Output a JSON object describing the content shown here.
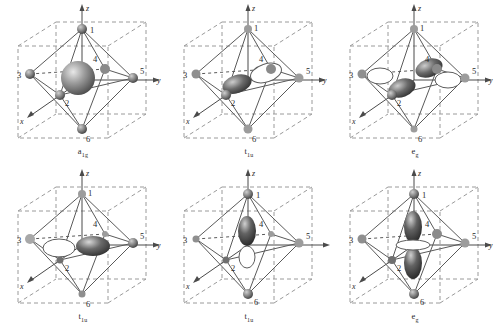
{
  "figure": {
    "rows": 2,
    "columns": 3,
    "panel_width": 166,
    "panel_height": 166,
    "background": "#ffffff"
  },
  "style": {
    "cube_line": "#9a9a9a",
    "octahedron_line": "#5a5a5a",
    "axis_line": "#4a4a4a",
    "vertex_fill": "#6f6f6f",
    "vertex_fill_light": "#a8a8a8",
    "lobe_dark": "#4a4a4a",
    "lobe_light": "#ffffff",
    "text": "#2b2b2b"
  },
  "axes": {
    "x": "x",
    "y": "y",
    "z": "z"
  },
  "vertices": [
    "1",
    "2",
    "3",
    "4",
    "5",
    "6"
  ],
  "panels": [
    {
      "id": "panel-a1g",
      "caption_main": "a",
      "caption_sub": "1g",
      "orbital": "s-type sphere",
      "position": "top-left",
      "row": 1,
      "column": 1
    },
    {
      "id": "panel-t1u-x",
      "caption_main": "t",
      "caption_sub": "1u",
      "orbital": "p-type along x",
      "position": "top-middle",
      "row": 1,
      "column": 2
    },
    {
      "id": "panel-eg-x2y2",
      "caption_main": "e",
      "caption_sub": "g",
      "orbital": "d-type x2-y2",
      "position": "top-right",
      "row": 1,
      "column": 3
    },
    {
      "id": "panel-t1u-y",
      "caption_main": "t",
      "caption_sub": "1u",
      "orbital": "p-type along y",
      "position": "bottom-left",
      "row": 2,
      "column": 1
    },
    {
      "id": "panel-t1u-z",
      "caption_main": "t",
      "caption_sub": "1u",
      "orbital": "p-type along z",
      "position": "bottom-middle",
      "row": 2,
      "column": 2
    },
    {
      "id": "panel-eg-z2",
      "caption_main": "e",
      "caption_sub": "g",
      "orbital": "d-type z2",
      "position": "bottom-right",
      "row": 2,
      "column": 3
    }
  ]
}
